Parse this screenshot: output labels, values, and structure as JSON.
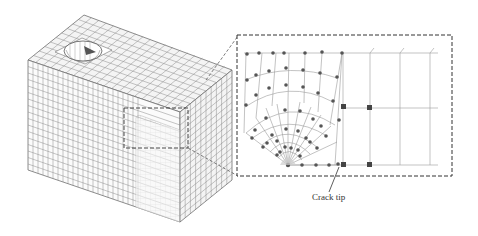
{
  "figure": {
    "annotations": {
      "crack_tip_label": "Crack tip"
    },
    "colors": {
      "mesh_line": "#7a7a7a",
      "node": "#555555",
      "dashed": "#333333",
      "light_mesh": "#bdbdbd"
    }
  }
}
